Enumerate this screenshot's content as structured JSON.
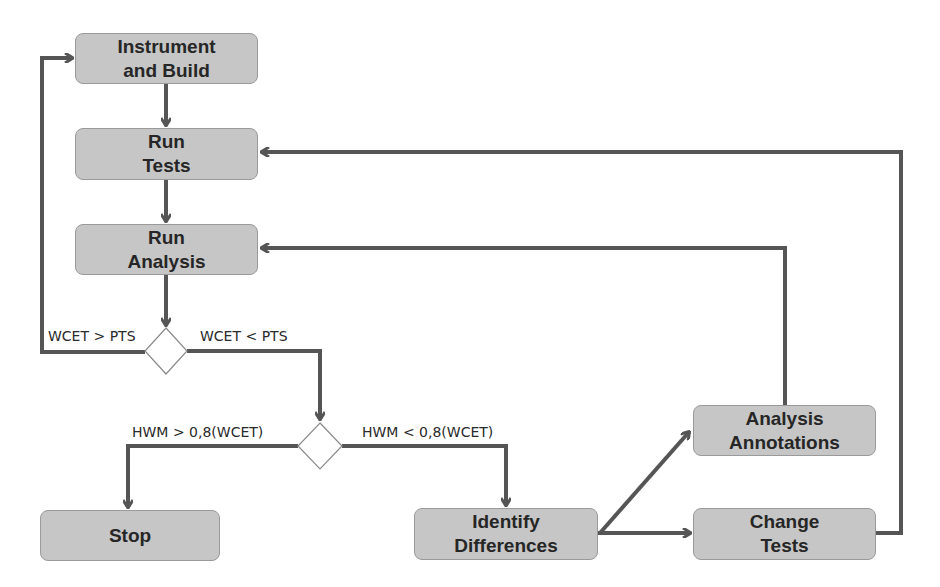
{
  "diagram": {
    "type": "flowchart",
    "colors": {
      "node_fill": "#c6c6c6",
      "node_border": "#9a9a9a",
      "arrow": "#555555",
      "decision_fill": "#ffffff"
    },
    "nodes": {
      "instrument_build": {
        "line1": "Instrument",
        "line2": "and Build"
      },
      "run_tests": {
        "line1": "Run",
        "line2": "Tests"
      },
      "run_analysis": {
        "line1": "Run",
        "line2": "Analysis"
      },
      "stop": {
        "line1": "Stop"
      },
      "identify_differences": {
        "line1": "Identify",
        "line2": "Differences"
      },
      "analysis_annotations": {
        "line1": "Analysis",
        "line2": "Annotations"
      },
      "change_tests": {
        "line1": "Change",
        "line2": "Tests"
      }
    },
    "decisions": {
      "wcet_vs_pts": {
        "left_label": "WCET > PTS",
        "right_label": "WCET < PTS"
      },
      "hwm_vs_wcet": {
        "left_label": "HWM > 0,8(WCET)",
        "right_label": "HWM < 0,8(WCET)"
      }
    },
    "edges": [
      {
        "from": "Instrument and Build",
        "to": "Run Tests"
      },
      {
        "from": "Run Tests",
        "to": "Run Analysis"
      },
      {
        "from": "Run Analysis",
        "to": "decision WCET vs PTS"
      },
      {
        "from": "decision WCET vs PTS",
        "to": "Instrument and Build",
        "label": "WCET > PTS"
      },
      {
        "from": "decision WCET vs PTS",
        "to": "decision HWM vs WCET",
        "label": "WCET < PTS"
      },
      {
        "from": "decision HWM vs WCET",
        "to": "Stop",
        "label": "HWM > 0,8(WCET)"
      },
      {
        "from": "decision HWM vs WCET",
        "to": "Identify Differences",
        "label": "HWM < 0,8(WCET)"
      },
      {
        "from": "Identify Differences",
        "to": "Analysis Annotations"
      },
      {
        "from": "Identify Differences",
        "to": "Change Tests"
      },
      {
        "from": "Analysis Annotations",
        "to": "Run Analysis"
      },
      {
        "from": "Change Tests",
        "to": "Run Tests"
      }
    ]
  }
}
